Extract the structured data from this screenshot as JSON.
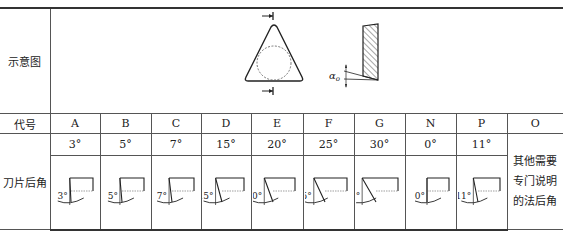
{
  "table": {
    "row_labels": {
      "diagram": "示意图",
      "code": "代号",
      "angle": "刀片后角"
    },
    "diagram": {
      "angle_symbol": "α",
      "angle_subscript": "o",
      "icons": [
        "triangle-insert-icon",
        "section-view-icon"
      ]
    },
    "columns": [
      {
        "code": "A",
        "angle": "3°",
        "fig_label": "3°",
        "deg": 3
      },
      {
        "code": "B",
        "angle": "5°",
        "fig_label": "5°",
        "deg": 5
      },
      {
        "code": "C",
        "angle": "7°",
        "fig_label": "7°",
        "deg": 7
      },
      {
        "code": "D",
        "angle": "15°",
        "fig_label": "15°",
        "deg": 15
      },
      {
        "code": "E",
        "angle": "20°",
        "fig_label": "20°",
        "deg": 20
      },
      {
        "code": "F",
        "angle": "25°",
        "fig_label": "25°",
        "deg": 25
      },
      {
        "code": "G",
        "angle": "30°",
        "fig_label": "30°",
        "deg": 30
      },
      {
        "code": "N",
        "angle": "0°",
        "fig_label": "0°",
        "deg": 0
      },
      {
        "code": "P",
        "angle": "11°",
        "fig_label": "11°",
        "deg": 11
      }
    ],
    "other": {
      "code": "O",
      "note": "其他需要专门说明的法后角",
      "note_lines": [
        "其他需要",
        "专门说明",
        "的法后角"
      ]
    }
  }
}
